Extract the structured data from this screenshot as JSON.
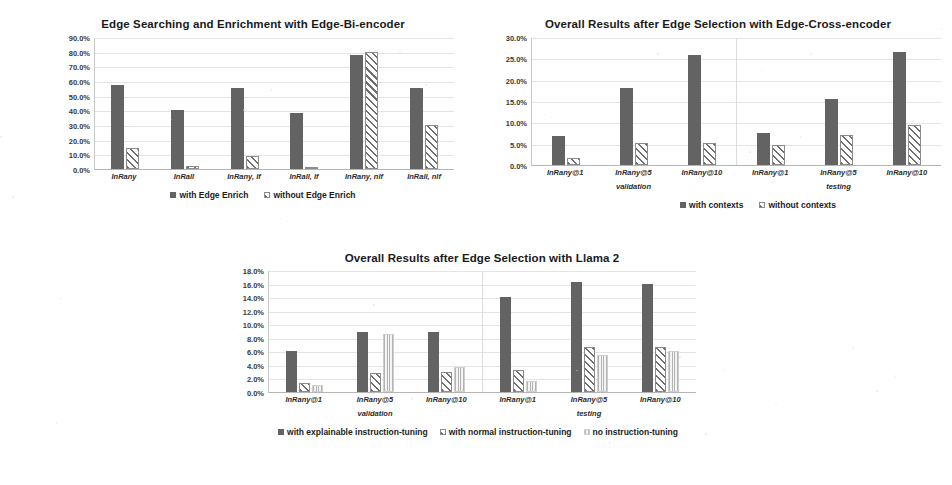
{
  "page": {
    "width": 952,
    "height": 485,
    "background": "#ffffff"
  },
  "charts": [
    {
      "id": "edge-bi-encoder",
      "chart_data": {
        "type": "bar",
        "title": "Edge Searching and Enrichment with Edge-Bi-encoder",
        "xlabel": "",
        "ylabel": "",
        "ylim": [
          0,
          90
        ],
        "ytick_labels": [
          "90.0%",
          "80.0%",
          "70.0%",
          "60.0%",
          "50.0%",
          "40.0%",
          "30.0%",
          "20.0%",
          "10.0%",
          "0.0%"
        ],
        "ytick_values": [
          90,
          80,
          70,
          60,
          50,
          40,
          30,
          20,
          10,
          0
        ],
        "grid": true,
        "legend_position": "bottom",
        "categories": [
          "InRany",
          "InRall",
          "InRany, lf",
          "InRall, lf",
          "InRany, nlf",
          "InRall, nlf"
        ],
        "series": [
          {
            "name": "with Edge Enrich",
            "pattern": "dark",
            "values": [
              57.0,
              40.0,
              55.0,
              38.5,
              78.0,
              55.0
            ]
          },
          {
            "name": "without Edge Enrich",
            "pattern": "hatch",
            "values": [
              14.0,
              2.0,
              9.0,
              1.5,
              80.0,
              30.0
            ]
          }
        ]
      }
    },
    {
      "id": "edge-cross-encoder",
      "chart_data": {
        "type": "bar",
        "title": "Overall Results after Edge Selection with Edge-Cross-encoder",
        "xlabel": "",
        "ylabel": "",
        "ylim": [
          0,
          30
        ],
        "ytick_labels": [
          "30.0%",
          "25.0%",
          "20.0%",
          "15.0%",
          "10.0%",
          "5.0%",
          "0.0%"
        ],
        "ytick_values": [
          30,
          25,
          20,
          15,
          10,
          5,
          0
        ],
        "grid": true,
        "legend_position": "bottom",
        "categories": [
          "InRany@1",
          "InRany@5",
          "InRany@10",
          "InRany@1",
          "InRany@5",
          "InRany@10"
        ],
        "group_labels": [
          {
            "label": "validation",
            "span": 3
          },
          {
            "label": "testing",
            "span": 3
          }
        ],
        "series": [
          {
            "name": "with contexts",
            "pattern": "dark",
            "values": [
              6.8,
              18.0,
              25.8,
              7.4,
              15.5,
              26.4
            ]
          },
          {
            "name": "without contexts",
            "pattern": "hatch",
            "values": [
              1.6,
              5.1,
              5.2,
              4.8,
              7.0,
              9.4
            ]
          }
        ]
      }
    },
    {
      "id": "llama-2",
      "chart_data": {
        "type": "bar",
        "title": "Overall Results after Edge Selection with Llama 2",
        "xlabel": "",
        "ylabel": "",
        "ylim": [
          0,
          18
        ],
        "ytick_labels": [
          "18.0%",
          "16.0%",
          "14.0%",
          "12.0%",
          "10.0%",
          "8.0%",
          "6.0%",
          "4.0%",
          "2.0%",
          "0.0%"
        ],
        "ytick_values": [
          18,
          16,
          14,
          12,
          10,
          8,
          6,
          4,
          2,
          0
        ],
        "grid": true,
        "legend_position": "bottom",
        "categories": [
          "InRany@1",
          "InRany@5",
          "InRany@10",
          "InRany@1",
          "InRany@5",
          "InRany@10"
        ],
        "group_labels": [
          {
            "label": "validation",
            "span": 3
          },
          {
            "label": "testing",
            "span": 3
          }
        ],
        "series": [
          {
            "name": "with explainable instruction-tuning",
            "pattern": "dark",
            "values": [
              6.1,
              8.9,
              8.8,
              14.0,
              16.3,
              16.0
            ]
          },
          {
            "name": "with normal instruction-tuning",
            "pattern": "hatch",
            "values": [
              1.3,
              2.8,
              3.0,
              3.2,
              6.6,
              6.7
            ]
          },
          {
            "name": "no instruction-tuning",
            "pattern": "vline",
            "values": [
              1.1,
              8.6,
              3.7,
              1.6,
              5.5,
              6.0
            ]
          }
        ]
      }
    }
  ]
}
